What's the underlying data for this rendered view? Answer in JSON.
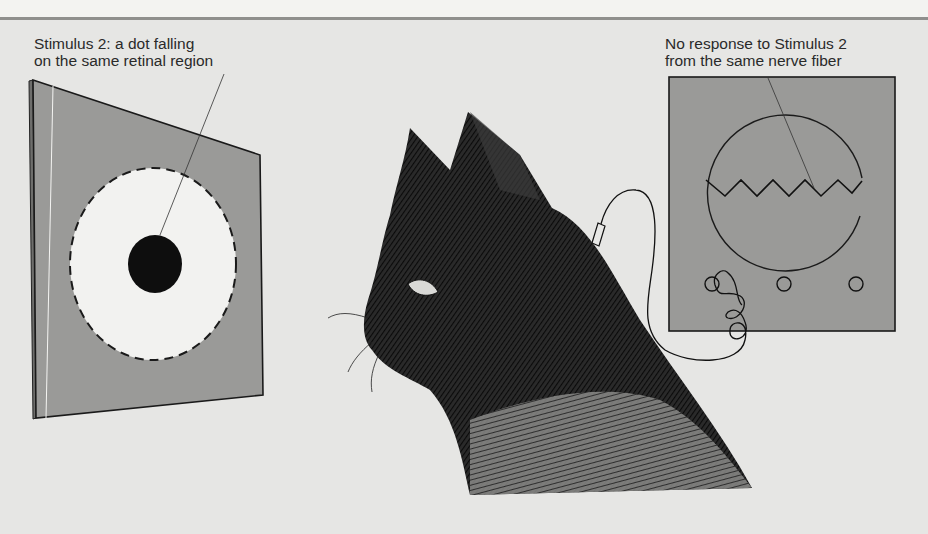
{
  "figure": {
    "stimulus_label": {
      "line1": "Stimulus 2: a dot falling",
      "line2": "on the same retinal region"
    },
    "response_label": {
      "line1": "No response to Stimulus 2",
      "line2": "from the same nerve fiber"
    },
    "elements": [
      "stimulus-screen",
      "receptive-field-circle",
      "black-dot-stimulus",
      "cat-head",
      "electrode",
      "oscilloscope",
      "flat-trace"
    ],
    "colors": {
      "background": "#e6e6e4",
      "screen_gray": "#9a9a98",
      "field_white": "#f2f2f0",
      "ink": "#111111"
    }
  }
}
